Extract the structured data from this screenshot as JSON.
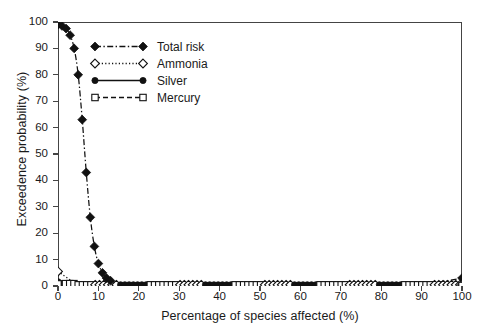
{
  "chart_data": {
    "type": "line",
    "title": "",
    "xlabel": "Percentage of species affected (%)",
    "ylabel": "Exceedence probability (%)",
    "xlim": [
      0,
      100
    ],
    "ylim": [
      0,
      100
    ],
    "xticks": [
      0,
      10,
      20,
      30,
      40,
      50,
      60,
      70,
      80,
      90,
      100
    ],
    "yticks": [
      0,
      10,
      20,
      30,
      40,
      50,
      60,
      70,
      80,
      90,
      100
    ],
    "grid": false,
    "legend_position": "upper-left-inside",
    "series": [
      {
        "name": "Total risk",
        "marker": "filled-diamond",
        "linestyle": "dash-dot",
        "color": "#111111",
        "x": [
          0,
          1,
          2,
          3,
          4,
          5,
          6,
          7,
          8,
          9,
          10,
          11,
          12,
          13,
          14,
          15,
          20,
          30,
          40,
          50,
          60,
          70,
          80,
          90,
          100
        ],
        "y": [
          99,
          98.5,
          97.5,
          95,
          90,
          80,
          63,
          43,
          26,
          15,
          8.5,
          5,
          3,
          2,
          1.4,
          1,
          0.8,
          0.7,
          0.7,
          0.6,
          0.6,
          0.6,
          0.6,
          0.6,
          3
        ]
      },
      {
        "name": "Ammonia",
        "marker": "open-diamond",
        "linestyle": "dotted",
        "color": "#111111",
        "x": [
          0,
          5,
          10,
          20,
          30,
          40,
          50,
          60,
          70,
          80,
          90,
          100
        ],
        "y": [
          5.5,
          0.8,
          0.5,
          0.4,
          0.4,
          0.4,
          0.4,
          0.4,
          0.4,
          0.4,
          0.4,
          0.4
        ]
      },
      {
        "name": "Silver",
        "marker": "filled-circle",
        "linestyle": "solid",
        "color": "#111111",
        "x": [
          0,
          5,
          10,
          20,
          30,
          40,
          50,
          60,
          70,
          80,
          90,
          100
        ],
        "y": [
          1.6,
          0.5,
          0.4,
          0.3,
          0.3,
          0.3,
          0.3,
          0.3,
          0.3,
          0.3,
          0.3,
          0.3
        ]
      },
      {
        "name": "Mercury",
        "marker": "open-square",
        "linestyle": "dashed",
        "color": "#111111",
        "x": [
          0,
          5,
          10,
          20,
          30,
          40,
          50,
          60,
          70,
          80,
          90,
          100
        ],
        "y": [
          0.8,
          0.3,
          0.2,
          0.2,
          0.2,
          0.2,
          0.2,
          0.2,
          0.2,
          0.2,
          0.2,
          0.2
        ]
      }
    ]
  },
  "axes": {
    "x_title": "Percentage of species affected (%)",
    "y_title": "Exceedence probability (%)",
    "x_tick_labels": [
      "0",
      "10",
      "20",
      "30",
      "40",
      "50",
      "60",
      "70",
      "80",
      "90",
      "100"
    ],
    "y_tick_labels": [
      "0",
      "10",
      "20",
      "30",
      "40",
      "50",
      "60",
      "70",
      "80",
      "90",
      "100"
    ]
  },
  "legend": {
    "items": [
      {
        "label": "Total risk",
        "marker": "filled-diamond",
        "linestyle": "dash-dot"
      },
      {
        "label": "Ammonia",
        "marker": "open-diamond",
        "linestyle": "dotted"
      },
      {
        "label": "Silver",
        "marker": "filled-circle",
        "linestyle": "solid"
      },
      {
        "label": "Mercury",
        "marker": "open-square",
        "linestyle": "dashed"
      }
    ]
  },
  "colors": {
    "ink": "#111111",
    "axis": "#444444",
    "background": "#ffffff"
  }
}
